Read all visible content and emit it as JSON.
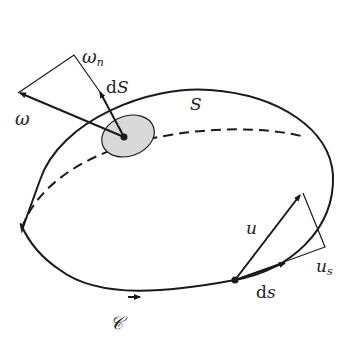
{
  "diagram": {
    "labels": {
      "omega": "ω",
      "omega_n_main": "ω",
      "omega_n_sub": "n",
      "dS_d": "d",
      "dS_S": "S",
      "surface": "S",
      "u": "u",
      "u_s_main": "u",
      "u_s_sub": "s",
      "ds_d": "d",
      "ds_s": "s",
      "curve": "𝒞"
    },
    "colors": {
      "stroke": "#1a1a1a",
      "patch_fill": "#d9d9d9"
    }
  }
}
